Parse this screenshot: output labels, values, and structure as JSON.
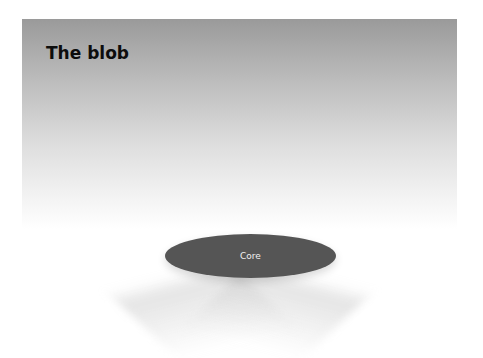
{
  "diagram": {
    "title": "The blob",
    "core": {
      "label": "Core",
      "color": "#555555"
    },
    "panel": {
      "gradient_top": "#9a9a9a",
      "gradient_bottom": "#ffffff"
    }
  }
}
